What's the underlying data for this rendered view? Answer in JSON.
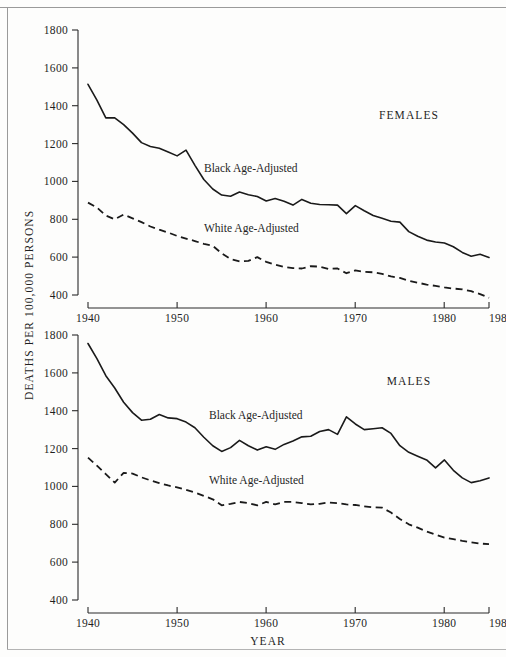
{
  "figure": {
    "y_axis_title": "DEATHS PER 100,000 PERSONS",
    "x_axis_title": "YEAR"
  },
  "panels": {
    "females": {
      "label": "FEMALES"
    },
    "males": {
      "label": "MALES"
    }
  },
  "series_labels": {
    "black": "Black Age-Adjusted",
    "white": "White Age-Adjusted"
  },
  "axis": {
    "y_ticks": [
      "1800",
      "1600",
      "1400",
      "1200",
      "1000",
      "800",
      "600",
      "400"
    ],
    "x_ticks": [
      "1940",
      "1950",
      "1960",
      "1970",
      "1980",
      "198"
    ]
  },
  "colors": {
    "ink": "#1a1a1a",
    "frame": "#9a9a9a",
    "background": "#fdfdfc"
  },
  "chart_data": [
    {
      "type": "line",
      "title": "FEMALES",
      "xlabel": "YEAR",
      "ylabel": "DEATHS PER 100,000 PERSONS",
      "xlim": [
        1940,
        1985
      ],
      "ylim": [
        400,
        1800
      ],
      "yticks": [
        400,
        600,
        800,
        1000,
        1200,
        1400,
        1600,
        1800
      ],
      "xticks": [
        1940,
        1950,
        1960,
        1970,
        1980,
        1985
      ],
      "grid": false,
      "legend": "inline-annotation",
      "x": [
        1940,
        1941,
        1942,
        1943,
        1944,
        1945,
        1946,
        1947,
        1948,
        1949,
        1950,
        1951,
        1952,
        1953,
        1954,
        1955,
        1956,
        1957,
        1958,
        1959,
        1960,
        1961,
        1962,
        1963,
        1964,
        1965,
        1966,
        1967,
        1968,
        1969,
        1970,
        1971,
        1972,
        1973,
        1974,
        1975,
        1976,
        1977,
        1978,
        1979,
        1980,
        1981,
        1982,
        1983,
        1984,
        1985
      ],
      "series": [
        {
          "name": "Black Age-Adjusted",
          "style": "solid",
          "values": [
            1513,
            1430,
            1336,
            1336,
            1300,
            1255,
            1205,
            1185,
            1175,
            1155,
            1135,
            1165,
            1085,
            1010,
            960,
            928,
            922,
            944,
            930,
            920,
            897,
            910,
            895,
            875,
            905,
            885,
            878,
            877,
            875,
            830,
            872,
            845,
            820,
            805,
            790,
            785,
            735,
            710,
            690,
            680,
            675,
            655,
            625,
            605,
            615,
            598
          ]
        },
        {
          "name": "White Age-Adjusted",
          "style": "dashed",
          "values": [
            888,
            862,
            820,
            800,
            825,
            805,
            785,
            762,
            745,
            730,
            712,
            698,
            685,
            670,
            660,
            620,
            590,
            578,
            580,
            600,
            575,
            560,
            548,
            542,
            540,
            552,
            550,
            538,
            540,
            515,
            530,
            522,
            520,
            512,
            498,
            490,
            475,
            465,
            455,
            448,
            440,
            434,
            430,
            420,
            405,
            385
          ]
        }
      ]
    },
    {
      "type": "line",
      "title": "MALES",
      "xlabel": "YEAR",
      "ylabel": "DEATHS PER 100,000 PERSONS",
      "xlim": [
        1940,
        1985
      ],
      "ylim": [
        400,
        1800
      ],
      "yticks": [
        400,
        600,
        800,
        1000,
        1200,
        1400,
        1600,
        1800
      ],
      "xticks": [
        1940,
        1950,
        1960,
        1970,
        1980,
        1985
      ],
      "grid": false,
      "legend": "inline-annotation",
      "x": [
        1940,
        1941,
        1942,
        1943,
        1944,
        1945,
        1946,
        1947,
        1948,
        1949,
        1950,
        1951,
        1952,
        1953,
        1954,
        1955,
        1956,
        1957,
        1958,
        1959,
        1960,
        1961,
        1962,
        1963,
        1964,
        1965,
        1966,
        1967,
        1968,
        1969,
        1970,
        1971,
        1972,
        1973,
        1974,
        1975,
        1976,
        1977,
        1978,
        1979,
        1980,
        1981,
        1982,
        1983,
        1984,
        1985
      ],
      "series": [
        {
          "name": "Black Age-Adjusted",
          "style": "solid",
          "values": [
            1755,
            1675,
            1585,
            1520,
            1445,
            1390,
            1350,
            1355,
            1380,
            1362,
            1358,
            1340,
            1310,
            1260,
            1215,
            1185,
            1205,
            1243,
            1215,
            1192,
            1210,
            1196,
            1222,
            1240,
            1262,
            1265,
            1290,
            1300,
            1275,
            1368,
            1330,
            1300,
            1305,
            1310,
            1280,
            1215,
            1180,
            1160,
            1140,
            1098,
            1140,
            1085,
            1045,
            1020,
            1030,
            1045
          ]
        },
        {
          "name": "White Age-Adjusted",
          "style": "dashed",
          "values": [
            1152,
            1110,
            1065,
            1020,
            1072,
            1068,
            1048,
            1032,
            1018,
            1005,
            995,
            982,
            968,
            950,
            932,
            900,
            908,
            918,
            912,
            900,
            918,
            905,
            918,
            918,
            912,
            905,
            908,
            915,
            912,
            905,
            902,
            895,
            890,
            888,
            862,
            828,
            800,
            782,
            762,
            745,
            730,
            722,
            712,
            705,
            698,
            695
          ]
        }
      ]
    }
  ]
}
